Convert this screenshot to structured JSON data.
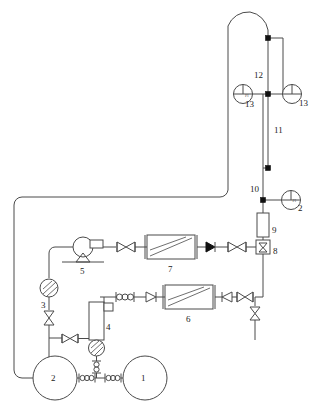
{
  "diagram": {
    "type": "piping-and-instrumentation",
    "background_color": "#ffffff",
    "line_color": "#4a4a4a"
  },
  "labels": {
    "tank_1": "1",
    "tank_2": "2",
    "meter_3": "3",
    "vessel_4": "4",
    "pump_5": "5",
    "exchanger_6": "6",
    "exchanger_7": "7",
    "valve_8": "8",
    "filter_9": "9",
    "line_10": "10",
    "line_11": "11",
    "line_12": "12",
    "gauge_13_left": "13",
    "gauge_13_right": "13",
    "gauge_2_right": "2"
  },
  "gauge_text": {
    "pi": "PI"
  },
  "components": [
    {
      "id": "1",
      "name": "tank-1",
      "kind": "circular-tank"
    },
    {
      "id": "2",
      "name": "tank-2",
      "kind": "circular-tank"
    },
    {
      "id": "3",
      "name": "meter-3",
      "kind": "hatched-circle-meter"
    },
    {
      "id": "4",
      "name": "vessel-4",
      "kind": "vertical-vessel"
    },
    {
      "id": "5",
      "name": "pump-5",
      "kind": "centrifugal-pump"
    },
    {
      "id": "6",
      "name": "heat-exchanger-6",
      "kind": "heat-exchanger"
    },
    {
      "id": "7",
      "name": "heat-exchanger-7",
      "kind": "heat-exchanger"
    },
    {
      "id": "8",
      "name": "valve-8",
      "kind": "boxed-valve"
    },
    {
      "id": "9",
      "name": "filter-9",
      "kind": "vertical-column"
    },
    {
      "id": "10",
      "name": "line-10",
      "kind": "pipe-label"
    },
    {
      "id": "11",
      "name": "line-11",
      "kind": "pipe-label"
    },
    {
      "id": "12",
      "name": "line-12",
      "kind": "pipe-label"
    },
    {
      "id": "13",
      "name": "gauge-13",
      "kind": "pressure-gauge"
    }
  ]
}
